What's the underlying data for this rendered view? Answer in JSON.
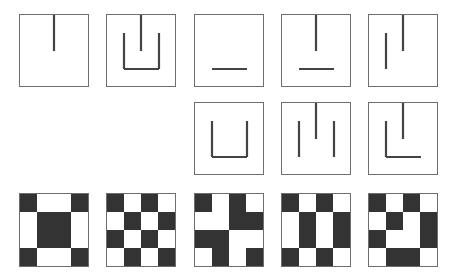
{
  "colors": {
    "border": "#6e6e6e",
    "stroke": "#444444",
    "dark_cell": "#333333",
    "light_cell": "#ffffff"
  },
  "line_figures": [
    {
      "id": "fig-1",
      "row": 1,
      "col": 1,
      "x": 19,
      "y": 14,
      "segments": [
        "top-stem"
      ]
    },
    {
      "id": "fig-2",
      "row": 1,
      "col": 2,
      "x": 106,
      "y": 14,
      "segments": [
        "top-stem",
        "u-shape"
      ]
    },
    {
      "id": "fig-3",
      "row": 1,
      "col": 3,
      "x": 194,
      "y": 14,
      "segments": [
        "bottom-bar"
      ]
    },
    {
      "id": "fig-4",
      "row": 1,
      "col": 4,
      "x": 281,
      "y": 14,
      "segments": [
        "top-stem",
        "bottom-bar"
      ]
    },
    {
      "id": "fig-5",
      "row": 1,
      "col": 5,
      "x": 368,
      "y": 14,
      "segments": [
        "top-stem",
        "left-bar"
      ]
    },
    {
      "id": "fig-6",
      "row": 2,
      "col": 3,
      "x": 194,
      "y": 102,
      "segments": [
        "u-shape"
      ]
    },
    {
      "id": "fig-7",
      "row": 2,
      "col": 4,
      "x": 281,
      "y": 102,
      "segments": [
        "top-stem",
        "left-bar",
        "right-bar"
      ]
    },
    {
      "id": "fig-8",
      "row": 2,
      "col": 5,
      "x": 368,
      "y": 102,
      "segments": [
        "top-stem",
        "l-shape"
      ]
    }
  ],
  "grid_patterns": [
    {
      "id": "pattern-1",
      "x": 19,
      "y": 193,
      "cells": [
        [
          1,
          0,
          0,
          1
        ],
        [
          0,
          1,
          1,
          0
        ],
        [
          0,
          1,
          1,
          0
        ],
        [
          1,
          0,
          0,
          1
        ]
      ]
    },
    {
      "id": "pattern-2",
      "x": 106,
      "y": 193,
      "cells": [
        [
          1,
          0,
          1,
          0
        ],
        [
          0,
          1,
          0,
          1
        ],
        [
          1,
          0,
          1,
          0
        ],
        [
          0,
          1,
          0,
          1
        ]
      ]
    },
    {
      "id": "pattern-3",
      "x": 194,
      "y": 193,
      "cells": [
        [
          1,
          0,
          1,
          0
        ],
        [
          0,
          0,
          1,
          1
        ],
        [
          1,
          1,
          0,
          0
        ],
        [
          0,
          1,
          0,
          1
        ]
      ]
    },
    {
      "id": "pattern-4",
      "x": 281,
      "y": 193,
      "cells": [
        [
          1,
          0,
          1,
          0
        ],
        [
          0,
          1,
          0,
          1
        ],
        [
          0,
          1,
          0,
          1
        ],
        [
          1,
          0,
          1,
          0
        ]
      ]
    },
    {
      "id": "pattern-5",
      "x": 368,
      "y": 193,
      "cells": [
        [
          1,
          0,
          1,
          0
        ],
        [
          0,
          1,
          0,
          1
        ],
        [
          1,
          0,
          0,
          1
        ],
        [
          0,
          1,
          1,
          0
        ]
      ]
    }
  ]
}
